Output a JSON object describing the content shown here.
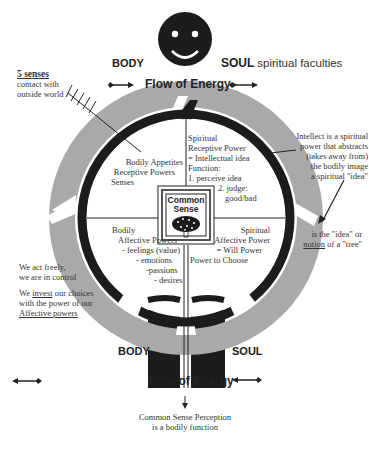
{
  "top": {
    "body_label": "BODY",
    "soul_label": "SOUL",
    "soul_suffix": "spiritual faculties",
    "flow_label": "Flow of Energy"
  },
  "senses": {
    "title": "5 senses",
    "line1": "contact with",
    "line2": "outside world"
  },
  "quadrants": {
    "top_left": [
      "Bodily Appetites",
      "Receptive Powers",
      "Senses"
    ],
    "top_right": [
      "Spiritual",
      "Receptive Power",
      "= Intellectual idea",
      "Function:",
      "1. perceive idea",
      "2. judge:",
      "good/bad"
    ],
    "bottom_left": [
      "Bodily",
      "Affective Powers",
      "- feelings (value)",
      "- emotions",
      "-passions",
      "- desires"
    ],
    "bottom_right": [
      "Spiritual",
      "Affective Power",
      "= Will Power",
      "Power to Choose"
    ]
  },
  "center": {
    "line1": "Common",
    "line2": "Sense"
  },
  "intellect_note": [
    "Intellect is a spiritual",
    "power that abstracts",
    "(takes away from)",
    "the bodily image",
    "a spiritual \"idea\""
  ],
  "idea_note": {
    "line1": "is the \"idea\" or",
    "notion_word": "notion",
    "line2_rest": " of a \"tree\""
  },
  "freedom_note": {
    "line1": "We act freely,",
    "line2": "we are in control",
    "line3_pre": "We ",
    "line3_u": "invest",
    "line3_post": " our choices",
    "line4": "with the power of our",
    "line5": "Affective powers"
  },
  "bottom": {
    "body_label": "BODY",
    "soul_label": "SOUL",
    "flow_label": "Flow of Energy",
    "note1": "Common Sense Perception",
    "note2": "is a bodily function"
  },
  "colors": {
    "ring_gray": "#a9a9a9",
    "ink": "#1c1c1c",
    "paper": "#ffffff"
  }
}
